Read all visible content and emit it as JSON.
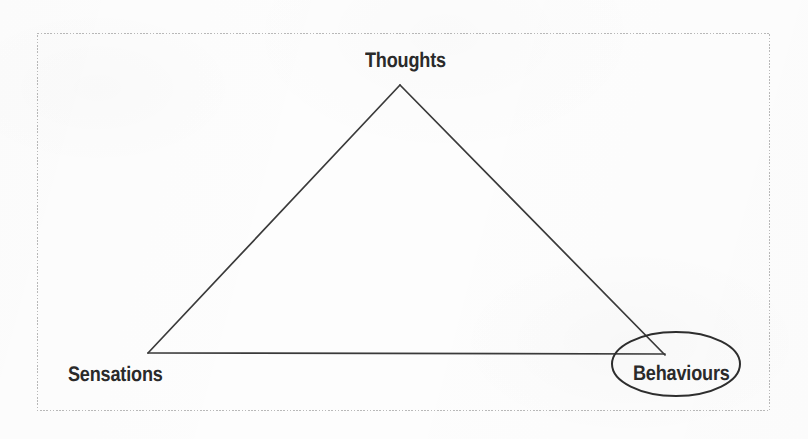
{
  "figure": {
    "background_color": "#fdfdfd",
    "frame": {
      "name": "figure-border",
      "style": "dotted",
      "color": "#b8b8b8",
      "x": 37,
      "y": 33,
      "width": 733,
      "height": 378
    },
    "nodes": [
      {
        "id": "thoughts",
        "label": "Thoughts",
        "position": "top",
        "x": 400,
        "y": 62,
        "highlighted": false
      },
      {
        "id": "sensations",
        "label": "Sensations",
        "position": "bottom-left",
        "x": 113,
        "y": 375,
        "highlighted": false
      },
      {
        "id": "behaviours",
        "label": "Behaviours",
        "position": "bottom-right",
        "x": 676,
        "y": 375,
        "highlighted": true
      }
    ],
    "triangle": {
      "name": "cbt-triangle",
      "stroke_color": "#3a3a3a",
      "stroke_width": 1.6,
      "fill": "none",
      "vertices": [
        {
          "label": "Thoughts",
          "x": 400,
          "y": 85
        },
        {
          "label": "Sensations",
          "x": 148,
          "y": 353
        },
        {
          "label": "Behaviours",
          "x": 665,
          "y": 355
        }
      ]
    },
    "highlight_ellipse": {
      "name": "behaviours-highlight-ellipse",
      "around": "Behaviours",
      "stroke_color": "#2e2e2e",
      "stroke_width": 2,
      "fill": "none",
      "cx": 676,
      "cy": 364,
      "rx": 64,
      "ry": 32
    }
  }
}
